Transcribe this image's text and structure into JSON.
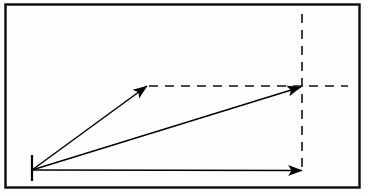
{
  "figure": {
    "canvas": {
      "width": 368,
      "height": 196
    },
    "colors": {
      "background": "#fdfdfd",
      "stroke": "#000000",
      "frame": "#0a0a0a"
    },
    "frame": {
      "name": "outer-border",
      "x": 5.5,
      "y": 4.5,
      "width": 354,
      "height": 183,
      "stroke_width": 2.4
    },
    "origin": {
      "name": "origin-point",
      "x": 32,
      "y": 170,
      "tick": {
        "x": 32,
        "y1": 155,
        "y2": 181,
        "stroke_width": 2.2
      }
    },
    "arrows": [
      {
        "name": "vector-a",
        "label": "steep-diagonal-arrow",
        "x1": 32,
        "y1": 170,
        "x2": 147,
        "y2": 86,
        "stroke_width": 1.5,
        "head_length": 13,
        "head_width": 7.5
      },
      {
        "name": "vector-resultant",
        "label": "shallow-diagonal-arrow",
        "x1": 32,
        "y1": 170,
        "x2": 301,
        "y2": 87,
        "stroke_width": 1.5,
        "head_length": 13,
        "head_width": 7.5
      },
      {
        "name": "vector-b",
        "label": "horizontal-arrow",
        "x1": 32,
        "y1": 170,
        "x2": 302,
        "y2": 170.5,
        "stroke_width": 1.5,
        "head_length": 13,
        "head_width": 7.5
      }
    ],
    "dashed_lines": [
      {
        "name": "dashed-horizontal-construction-line",
        "x1": 149,
        "y1": 86,
        "x2": 348,
        "y2": 86,
        "stroke_width": 1.6,
        "dash": "9 7"
      },
      {
        "name": "dashed-vertical-construction-line",
        "x1": 302,
        "y1": 14,
        "x2": 302,
        "y2": 167,
        "stroke_width": 1.6,
        "dash": "9 7"
      }
    ]
  }
}
